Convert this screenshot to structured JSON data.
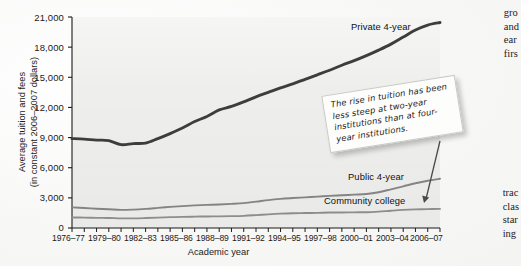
{
  "figure": {
    "axis_title_x": "Academic year",
    "axis_title_y_line1": "Average tuition and fees",
    "axis_title_y_line2": "(in constant 2006–2007 dollars)",
    "callout_text": "The rise in tuition has been less steep at two-year institutions than at four-year institutions."
  },
  "margins": {
    "top_fragments": [
      "gro",
      "and",
      "ear",
      "firs"
    ],
    "bottom_fragments": [
      "trac",
      "clas",
      "star",
      "ing"
    ]
  },
  "colors": {
    "private": "#3d3d3d",
    "public": "#848484",
    "community": "#8d8d8d",
    "plot_background": "#eeeeec",
    "axis": "#1b1b1b",
    "callout_border": "#c9c9c5"
  },
  "chart_data": {
    "type": "line",
    "title": "",
    "xlabel": "Academic year",
    "ylabel": "Average tuition and fees (in constant 2006–2007 dollars)",
    "ylim": [
      0,
      21000
    ],
    "yticks": [
      0,
      3000,
      6000,
      9000,
      12000,
      15000,
      18000,
      21000
    ],
    "ytick_labels": [
      "0",
      "3,000",
      "6,000",
      "9,000",
      "12,000",
      "15,000",
      "18,000",
      "21,000"
    ],
    "grid": false,
    "legend": "inline-series-labels",
    "x": [
      "1976–77",
      "1977–78",
      "1978–79",
      "1979–80",
      "1980–81",
      "1981–82",
      "1982–83",
      "1983–84",
      "1984–85",
      "1985–86",
      "1986–87",
      "1987–88",
      "1988–89",
      "1989–90",
      "1990–91",
      "1991–92",
      "1992–93",
      "1993–94",
      "1994–95",
      "1995–96",
      "1996–97",
      "1997–98",
      "1998–99",
      "1999–2000",
      "2000–01",
      "2001–02",
      "2002–03",
      "2003–04",
      "2004–05",
      "2005–06",
      "2006–07"
    ],
    "xtick_labels": [
      "1976–77",
      "1979–80",
      "1982–83",
      "1985–86",
      "1988–89",
      "1991–92",
      "1994–95",
      "1997–98",
      "2000–01",
      "2003–04",
      "2006–07"
    ],
    "xtick_indices": [
      0,
      3,
      6,
      9,
      12,
      15,
      18,
      21,
      24,
      27,
      30
    ],
    "series": [
      {
        "name": "Private 4-year",
        "color": "#3d3d3d",
        "label_position": "upper-right",
        "values": [
          8900,
          8850,
          8750,
          8700,
          8300,
          8400,
          8450,
          8900,
          9400,
          9950,
          10600,
          11100,
          11750,
          12100,
          12550,
          13050,
          13500,
          13950,
          14350,
          14800,
          15250,
          15700,
          16200,
          16650,
          17150,
          17700,
          18300,
          19000,
          19700,
          20200,
          20450
        ]
      },
      {
        "name": "Public 4-year",
        "color": "#848484",
        "label_position": "lower-right",
        "values": [
          2050,
          1990,
          1920,
          1870,
          1800,
          1830,
          1900,
          2000,
          2100,
          2180,
          2250,
          2300,
          2340,
          2400,
          2480,
          2620,
          2780,
          2900,
          2980,
          3050,
          3120,
          3200,
          3260,
          3320,
          3380,
          3560,
          3850,
          4150,
          4450,
          4700,
          4900
        ]
      },
      {
        "name": "Community college",
        "color": "#8d8d8d",
        "label_position": "lower-right",
        "values": [
          1050,
          1030,
          1010,
          1000,
          960,
          960,
          990,
          1030,
          1080,
          1110,
          1130,
          1150,
          1160,
          1180,
          1210,
          1280,
          1360,
          1430,
          1470,
          1490,
          1510,
          1540,
          1550,
          1560,
          1570,
          1630,
          1720,
          1800,
          1850,
          1880,
          1900
        ]
      }
    ],
    "annotation": {
      "text": "The rise in tuition has been less steep at two-year institutions than at four-year institutions.",
      "points_to": "Community college"
    }
  }
}
